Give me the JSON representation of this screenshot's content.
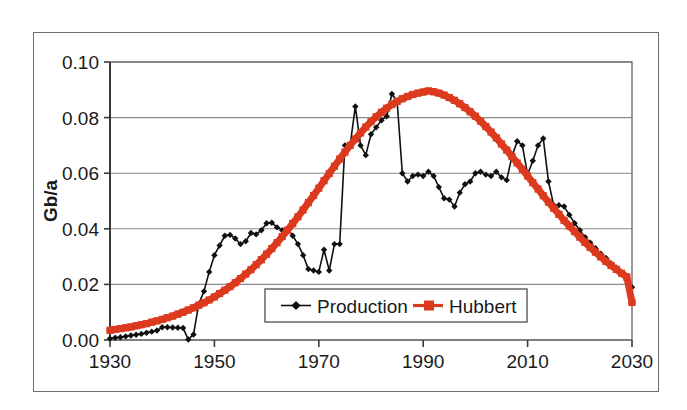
{
  "chart_data": {
    "type": "line",
    "title": "",
    "xlabel": "",
    "ylabel": "Gb/a",
    "xlim": [
      1930,
      2030
    ],
    "ylim": [
      0.0,
      0.1
    ],
    "grid": true,
    "legend_position": "inside-bottom-center",
    "xticks": [
      "1930",
      "1950",
      "1970",
      "1990",
      "2010",
      "2030"
    ],
    "xtick_values": [
      1930,
      1950,
      1970,
      1990,
      2010,
      2030
    ],
    "yticks": [
      "0.00",
      "0.02",
      "0.04",
      "0.06",
      "0.08",
      "0.10"
    ],
    "ytick_values": [
      0.0,
      0.02,
      0.04,
      0.06,
      0.08,
      0.1
    ],
    "series": [
      {
        "name": "Production",
        "color": "#111111",
        "marker": "diamond",
        "x": [
          1930,
          1931,
          1932,
          1933,
          1934,
          1935,
          1936,
          1937,
          1938,
          1939,
          1940,
          1941,
          1942,
          1943,
          1944,
          1945,
          1946,
          1947,
          1948,
          1949,
          1950,
          1951,
          1952,
          1953,
          1954,
          1955,
          1956,
          1957,
          1958,
          1959,
          1960,
          1961,
          1962,
          1963,
          1964,
          1965,
          1966,
          1967,
          1968,
          1969,
          1970,
          1971,
          1972,
          1973,
          1974,
          1975,
          1976,
          1977,
          1978,
          1979,
          1980,
          1981,
          1982,
          1983,
          1984,
          1985,
          1986,
          1987,
          1988,
          1989,
          1990,
          1991,
          1992,
          1993,
          1994,
          1995,
          1996,
          1997,
          1998,
          1999,
          2000,
          2001,
          2002,
          2003,
          2004,
          2005,
          2006,
          2007,
          2008,
          2009,
          2010,
          2011,
          2012,
          2013,
          2014,
          2015,
          2016,
          2017,
          2018,
          2019,
          2020,
          2021,
          2022,
          2023,
          2024,
          2025,
          2026,
          2027,
          2028,
          2029,
          2030
        ],
        "y": [
          0.0005,
          0.0008,
          0.001,
          0.0013,
          0.0016,
          0.0019,
          0.0022,
          0.0026,
          0.003,
          0.0034,
          0.0046,
          0.0046,
          0.0045,
          0.0044,
          0.0043,
          0.0002,
          0.002,
          0.013,
          0.0175,
          0.0245,
          0.0305,
          0.034,
          0.0375,
          0.0378,
          0.0365,
          0.0345,
          0.0355,
          0.0385,
          0.038,
          0.0395,
          0.042,
          0.0422,
          0.0405,
          0.0395,
          0.04,
          0.0375,
          0.0345,
          0.0305,
          0.0255,
          0.025,
          0.0245,
          0.0325,
          0.025,
          0.0345,
          0.0345,
          0.07,
          0.07,
          0.084,
          0.07,
          0.0665,
          0.074,
          0.0765,
          0.079,
          0.0805,
          0.0885,
          0.086,
          0.06,
          0.057,
          0.059,
          0.0595,
          0.059,
          0.0605,
          0.059,
          0.055,
          0.051,
          0.0505,
          0.048,
          0.053,
          0.056,
          0.057,
          0.06,
          0.0605,
          0.0595,
          0.059,
          0.0605,
          0.0585,
          0.0575,
          0.066,
          0.0715,
          0.07,
          0.0595,
          0.0645,
          0.07,
          0.0725,
          0.057,
          0.0485,
          0.0485,
          0.048,
          0.045,
          0.042,
          0.0395,
          0.037,
          0.035,
          0.033,
          0.031,
          0.0295,
          0.0275,
          0.026,
          0.024,
          0.0215,
          0.019
        ]
      },
      {
        "name": "Hubbert",
        "color": "#DC3A1E",
        "marker": "square",
        "x": [
          1930,
          1931,
          1932,
          1933,
          1934,
          1935,
          1936,
          1937,
          1938,
          1939,
          1940,
          1941,
          1942,
          1943,
          1944,
          1945,
          1946,
          1947,
          1948,
          1949,
          1950,
          1951,
          1952,
          1953,
          1954,
          1955,
          1956,
          1957,
          1958,
          1959,
          1960,
          1961,
          1962,
          1963,
          1964,
          1965,
          1966,
          1967,
          1968,
          1969,
          1970,
          1971,
          1972,
          1973,
          1974,
          1975,
          1976,
          1977,
          1978,
          1979,
          1980,
          1981,
          1982,
          1983,
          1984,
          1985,
          1986,
          1987,
          1988,
          1989,
          1990,
          1991,
          1992,
          1993,
          1994,
          1995,
          1996,
          1997,
          1998,
          1999,
          2000,
          2001,
          2002,
          2003,
          2004,
          2005,
          2006,
          2007,
          2008,
          2009,
          2010,
          2011,
          2012,
          2013,
          2014,
          2015,
          2016,
          2017,
          2018,
          2019,
          2020,
          2021,
          2022,
          2023,
          2024,
          2025,
          2026,
          2027,
          2028,
          2029,
          2030
        ],
        "y": [
          0.0035,
          0.0038,
          0.0041,
          0.0044,
          0.0047,
          0.0051,
          0.0055,
          0.0059,
          0.0064,
          0.0069,
          0.0074,
          0.008,
          0.0086,
          0.0093,
          0.01,
          0.0108,
          0.0116,
          0.0125,
          0.0134,
          0.0144,
          0.0155,
          0.0167,
          0.0179,
          0.0192,
          0.0206,
          0.0221,
          0.0237,
          0.0253,
          0.0271,
          0.0289,
          0.0309,
          0.0329,
          0.035,
          0.0372,
          0.0395,
          0.0419,
          0.0443,
          0.0468,
          0.0494,
          0.052,
          0.0546,
          0.0573,
          0.0599,
          0.0625,
          0.0651,
          0.0676,
          0.07,
          0.0723,
          0.0745,
          0.0766,
          0.0785,
          0.0803,
          0.0819,
          0.0834,
          0.0847,
          0.0858,
          0.0868,
          0.0876,
          0.0883,
          0.0888,
          0.0892,
          0.0896,
          0.0893,
          0.0888,
          0.0881,
          0.0872,
          0.0862,
          0.085,
          0.0836,
          0.0821,
          0.0805,
          0.0787,
          0.0768,
          0.0748,
          0.0727,
          0.0705,
          0.0683,
          0.066,
          0.0637,
          0.0614,
          0.059,
          0.0566,
          0.0543,
          0.0519,
          0.0496,
          0.0474,
          0.0452,
          0.043,
          0.041,
          0.039,
          0.037,
          0.0351,
          0.0333,
          0.0316,
          0.0299,
          0.0283,
          0.0268,
          0.0254,
          0.024,
          0.0227,
          0.0135
        ]
      }
    ]
  },
  "legend": {
    "entries": [
      {
        "label": "Production"
      },
      {
        "label": "Hubbert"
      }
    ]
  },
  "axis": {
    "y_title": "Gb/a"
  }
}
